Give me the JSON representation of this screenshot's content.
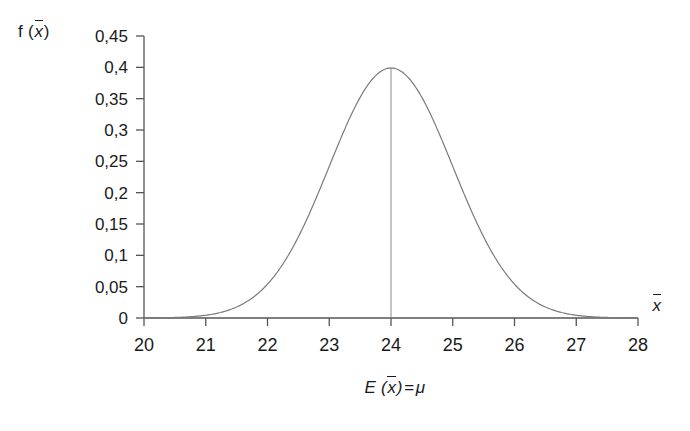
{
  "chart_data": {
    "type": "line",
    "title": "",
    "subtitle": "",
    "xlabel": "x̄",
    "ylabel": "f (x̄)",
    "caption": "E (x̄) = μ",
    "grid": false,
    "legend": "none",
    "xlim": [
      20,
      28
    ],
    "ylim": [
      0,
      0.45
    ],
    "x_ticks": [
      20,
      21,
      22,
      23,
      24,
      25,
      26,
      27,
      28
    ],
    "x_tick_labels": [
      "20",
      "21",
      "22",
      "23",
      "24",
      "25",
      "26",
      "27",
      "28"
    ],
    "y_ticks": [
      0,
      0.05,
      0.1,
      0.15,
      0.2,
      0.25,
      0.3,
      0.35,
      0.4,
      0.45
    ],
    "y_tick_labels": [
      "0",
      "0,05",
      "0,1",
      "0,15",
      "0,2",
      "0,25",
      "0,3",
      "0,35",
      "0,4",
      "0,45"
    ],
    "distribution": {
      "name": "normal",
      "mean": 24,
      "sigma": 1,
      "peak_value": 0.3989
    },
    "annotations": [
      {
        "name": "mean-vertical-line",
        "x": 24,
        "y_from": 0,
        "y_to": 0.3989
      }
    ],
    "series": [
      {
        "name": "normal-density",
        "color": "#7a7a7a",
        "x": [
          20,
          20.25,
          20.5,
          20.75,
          21,
          21.25,
          21.5,
          21.75,
          22,
          22.25,
          22.5,
          22.75,
          23,
          23.25,
          23.5,
          23.75,
          24,
          24.25,
          24.5,
          24.75,
          25,
          25.25,
          25.5,
          25.75,
          26,
          26.25,
          26.5,
          26.75,
          27,
          27.25,
          27.5,
          27.75,
          28
        ],
        "values": [
          0.0001,
          0.0004,
          0.0009,
          0.0022,
          0.0044,
          0.0088,
          0.0175,
          0.0325,
          0.054,
          0.0863,
          0.1295,
          0.1826,
          0.242,
          0.3011,
          0.3521,
          0.3867,
          0.3989,
          0.3867,
          0.3521,
          0.3011,
          0.242,
          0.1826,
          0.1295,
          0.0863,
          0.054,
          0.0325,
          0.0175,
          0.0088,
          0.0044,
          0.0022,
          0.0009,
          0.0004,
          0.0001
        ]
      }
    ]
  },
  "colors": {
    "curve": "#7a7a7a",
    "axis": "#555555",
    "text": "#1a1a1a",
    "background": "#ffffff"
  }
}
